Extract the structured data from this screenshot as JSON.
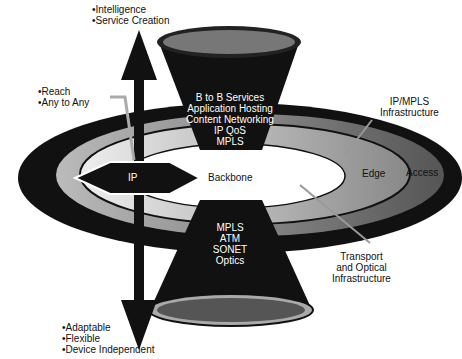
{
  "top_labels": [
    "Intelligence",
    "Service Creation"
  ],
  "left_labels": [
    "Reach",
    "Any to Any"
  ],
  "bottom_labels": [
    "Adaptable",
    "Flexible",
    "Device Independent"
  ],
  "upper_funnel": [
    "B to B Services",
    "Application Hosting",
    "Content Networking",
    "IP QoS",
    "MPLS"
  ],
  "lower_funnel": [
    "MPLS",
    "ATM",
    "SONET",
    "Optics"
  ],
  "center": {
    "ip": "IP",
    "backbone": "Backbone"
  },
  "rings": {
    "edge": "Edge",
    "access": "Access"
  },
  "callouts": {
    "ip_mpls": [
      "IP/MPLS",
      "Infrastructure"
    ],
    "transport": [
      "Transport",
      "and Optical",
      "Infrastructure"
    ]
  },
  "colors": {
    "dark": "#111111",
    "mid_gray": "#9a9a9a",
    "light_gray": "#d6d6d6",
    "white": "#ffffff"
  }
}
